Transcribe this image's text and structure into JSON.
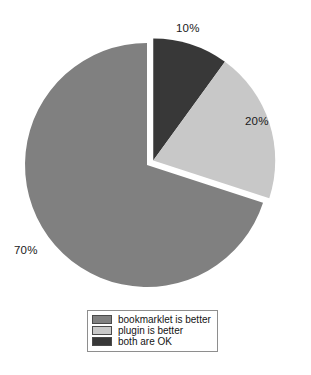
{
  "chart_data": {
    "type": "pie",
    "title": "",
    "categories": [
      "bookmarklet is better",
      "plugin is better",
      "both are OK"
    ],
    "values": [
      70,
      20,
      10
    ],
    "value_labels": [
      "70%",
      "20%",
      "10%"
    ],
    "colors": [
      "#808080",
      "#c8c8c8",
      "#383838"
    ],
    "exploded": [
      "plugin is better",
      "both are OK"
    ],
    "legend_position": "bottom",
    "grid": false,
    "background": "#ffffff",
    "slices": [
      {
        "label": "bookmarklet is better",
        "value": 70,
        "display": "70%",
        "color": "#808080",
        "exploded": false
      },
      {
        "label": "plugin is better",
        "value": 20,
        "display": "20%",
        "color": "#c8c8c8",
        "exploded": true
      },
      {
        "label": "both are OK",
        "value": 10,
        "display": "10%",
        "color": "#383838",
        "exploded": true
      }
    ]
  },
  "labels": {
    "slice_10": "10%",
    "slice_20": "20%",
    "slice_70": "70%"
  },
  "legend": {
    "items": [
      {
        "label": "bookmarklet is better",
        "color": "#808080"
      },
      {
        "label": "plugin is better",
        "color": "#c8c8c8"
      },
      {
        "label": "both are OK",
        "color": "#383838"
      }
    ]
  }
}
